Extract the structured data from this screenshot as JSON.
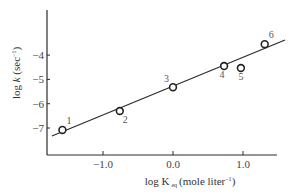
{
  "chart_data": {
    "type": "scatter",
    "title": "",
    "xlabel": {
      "prefix": "log K",
      "subscript": "eq",
      "suffix": "(mole liter",
      "superscript": "−1",
      "close": ")"
    },
    "ylabel": {
      "prefix": "log ",
      "italic": "k",
      "suffix": " (sec",
      "superscript": "−1",
      "close": ")"
    },
    "xlim": [
      -1.8,
      1.5
    ],
    "ylim": [
      -8.1,
      -2.2
    ],
    "xticks": [
      {
        "value": -1.0,
        "label": "−1.0"
      },
      {
        "value": 0.0,
        "label": "0.0"
      },
      {
        "value": 1.0,
        "label": "1.0"
      }
    ],
    "yticks": [
      {
        "value": -4,
        "label": "−4"
      },
      {
        "value": -5,
        "label": "−5"
      },
      {
        "value": -6,
        "label": "−6"
      },
      {
        "value": -7,
        "label": "−7"
      }
    ],
    "grid": false,
    "points": [
      {
        "label": "1",
        "x": -1.58,
        "y": -7.08,
        "label_pos": "above-right"
      },
      {
        "label": "2",
        "x": -0.76,
        "y": -6.3,
        "label_pos": "below-right"
      },
      {
        "label": "3",
        "x": 0.0,
        "y": -5.32,
        "label_pos": "above-left"
      },
      {
        "label": "4",
        "x": 0.73,
        "y": -4.45,
        "label_pos": "below-left"
      },
      {
        "label": "5",
        "x": 0.97,
        "y": -4.53,
        "label_pos": "below"
      },
      {
        "label": "6",
        "x": 1.31,
        "y": -3.55,
        "label_pos": "above-right"
      }
    ],
    "fit_line": {
      "x": [
        -1.73,
        1.6
      ],
      "y": [
        -7.33,
        -3.38
      ]
    }
  }
}
